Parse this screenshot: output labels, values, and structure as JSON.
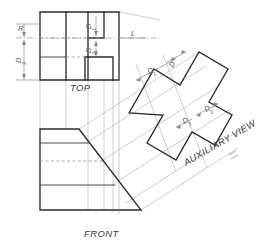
{
  "sheet": {
    "width": 260,
    "height": 246,
    "background": "#ffffff",
    "object_line_color": "#2b2b2b",
    "projection_line_color": "#b3b3b3",
    "hidden_line_color": "#8e8e8e",
    "dimension_line_color": "#8a8a8a",
    "title": "Orthographic multiview with auxiliary view"
  },
  "views": {
    "top": {
      "label": "TOP",
      "label_x": 70,
      "label_y": 91
    },
    "front": {
      "label": "FRONT",
      "label_x": 84,
      "label_y": 237
    },
    "auxiliary": {
      "label": "AUXILIARY VIEW",
      "label_x": 186,
      "label_y": 166,
      "rotation": -30
    }
  },
  "dimensions": {
    "radius": {
      "label": "R",
      "x": 21,
      "y": 34
    },
    "height_left": {
      "label": "D",
      "sub": "3",
      "x": 25,
      "y": 63
    },
    "length_top": {
      "label": "L",
      "x": 131,
      "y": 38
    },
    "aux_d": {
      "label": "D",
      "sub": "",
      "x": 173,
      "y": 68
    },
    "aux_d1": {
      "label": "D",
      "sub": "1",
      "x": 149,
      "y": 79
    },
    "aux_d2": {
      "label": "D",
      "sub": "2",
      "x": 210,
      "y": 113
    },
    "aux_d3": {
      "label": "D",
      "sub": "3",
      "x": 186,
      "y": 122
    },
    "top_inner_d1": {
      "label": "D",
      "sub": "1",
      "x": 93,
      "y": 27
    },
    "top_inner_d2": {
      "label": "D",
      "sub": "2",
      "x": 93,
      "y": 52
    }
  },
  "geometry": {
    "top_view_outline": "M 40,12 L 119,12 L 119,80 L 40,80 Z",
    "top_view_inner_vertical_a": "M 66,12 L 66,80",
    "top_view_inner_vertical_b": "M 88,12 L 88,80",
    "top_view_notch_upper": "M 88,12 L 88,38 L 104,38 L 104,12",
    "top_view_notch_lower": "M 85,57 L 85,80 L 113,80 L 113,57 Z",
    "top_view_hline_left": "M 40,57 L 66,57",
    "front_view_outline": "M 40,129 L 79,129 L 141,210 L 40,210 Z",
    "front_view_step_a": "M 40,143 L 86,143",
    "front_view_step_b": "M 40,185 L 112,185",
    "aux_view_outline": "M 129,113 L 154,69 L 180,85 L 199,52 L 228,69 L 209,102 L 232,115 L 215,145 L 192,132 L 176,160 L 147,143 L 163,115 Z"
  }
}
